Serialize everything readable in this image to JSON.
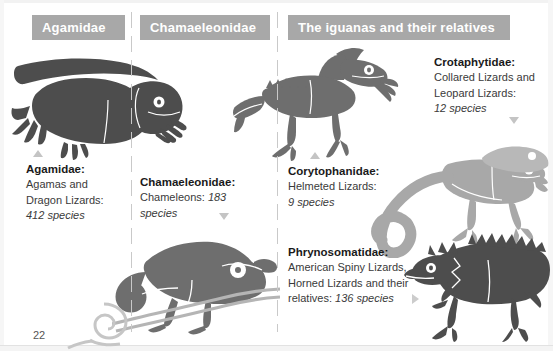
{
  "page": {
    "number": "22",
    "colors": {
      "header_bar_fill": "#a8a8a8",
      "header_bar_text": "#ffffff",
      "body_text": "#3a3a3a",
      "title_text": "#1a1a1a",
      "marker_triangle": "#c4c4c4",
      "silhouette_dark": "#4d4d4d",
      "silhouette_mid": "#808080",
      "silhouette_light": "#a8a8a8",
      "divider": "#c9c9c9"
    }
  },
  "columns": [
    {
      "header": "Agamidae",
      "entries": [
        {
          "title": "Agamidae:",
          "description": "Agamas and Dragon Lizards:",
          "species": "412 species",
          "marker": "triangle-up"
        }
      ]
    },
    {
      "header": "Chamaeleonidae",
      "entries": [
        {
          "title": "Chamaeleonidae:",
          "description": "Chameleons:",
          "species": "183 species",
          "marker": "triangle-down"
        }
      ]
    },
    {
      "header": "The iguanas and their relatives",
      "entries": [
        {
          "title": "Crotaphytidae:",
          "description": "Collared Lizards and Leopard Lizards:",
          "species": "12 species",
          "marker": "triangle-down"
        },
        {
          "title": "Corytophanidae:",
          "description": "Helmeted Lizards:",
          "species": "9 species",
          "marker": "triangle-up"
        },
        {
          "title": "Phrynosomatidae:",
          "description": "American Spiny Lizards, Horned Lizards and their relatives:",
          "species": "136 species",
          "marker": "triangle-right"
        }
      ]
    }
  ],
  "artwork": [
    {
      "name": "agamid-lizard-silhouette",
      "shade": "dark"
    },
    {
      "name": "chameleon-on-branch-silhouette",
      "shade": "mid"
    },
    {
      "name": "helmeted-lizard-silhouette",
      "shade": "mid"
    },
    {
      "name": "collared-lizard-silhouette",
      "shade": "light"
    },
    {
      "name": "horned-lizard-silhouette",
      "shade": "dark"
    },
    {
      "name": "snail-silhouette",
      "shade": "light"
    }
  ],
  "text": {
    "agamidae": {
      "title": "Agamidae:",
      "line1": "Agamas and",
      "line2": "Dragon Lizards:",
      "line3": "412 species"
    },
    "chamaeleonidae": {
      "title": "Chamaeleonidae:",
      "line1_plain": "Chameleons: ",
      "line1_italic": "183",
      "line2_italic": "species"
    },
    "crotaphytidae": {
      "title": "Crotaphytidae:",
      "line1": "Collared Lizards and",
      "line2": "Leopard Lizards:",
      "line3": "12 species"
    },
    "corytophanidae": {
      "title": "Corytophanidae:",
      "line1": "Helmeted Lizards:",
      "line2": "9 species"
    },
    "phrynosomatidae": {
      "title": "Phrynosomatidae:",
      "line1": "American Spiny Lizards,",
      "line2": "Horned Lizards and their",
      "line3_plain": "relatives: ",
      "line3_italic": "136 species"
    }
  }
}
